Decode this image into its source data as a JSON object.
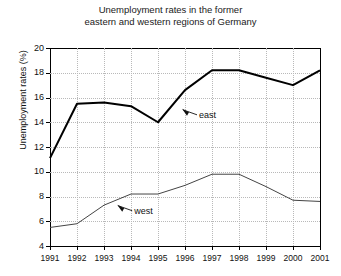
{
  "chart_data": {
    "type": "line",
    "title": "Unemployment rates in the former eastern and western regions of Germany",
    "title_line1": "Unemployment rates in the former",
    "title_line2": "eastern and western regions of Germany",
    "xlabel": "",
    "ylabel": "Unemployment rates (%)",
    "xlim": [
      1991,
      2001
    ],
    "ylim": [
      4,
      20
    ],
    "ytick_step": 2,
    "grid": true,
    "legend_position": "inline-annotations",
    "categories": [
      1991,
      1992,
      1993,
      1994,
      1995,
      1996,
      1997,
      1998,
      1999,
      2000,
      2001
    ],
    "tick_labels_x": [
      "1991",
      "1992",
      "1993",
      "1994",
      "1995",
      "1996",
      "1997",
      "1998",
      "1999",
      "2000",
      "2001"
    ],
    "tick_labels_y": [
      "4",
      "6",
      "8",
      "10",
      "12",
      "14",
      "16",
      "18",
      "20"
    ],
    "series": [
      {
        "name": "east",
        "color": "#000000",
        "line_width": 2,
        "values": [
          11.1,
          15.5,
          15.6,
          15.3,
          14.0,
          16.6,
          18.2,
          18.2,
          17.6,
          17.0,
          18.2
        ]
      },
      {
        "name": "west",
        "color": "#444444",
        "line_width": 1,
        "values": [
          5.5,
          5.8,
          7.3,
          8.2,
          8.2,
          8.9,
          9.8,
          9.8,
          8.8,
          7.7,
          7.6
        ]
      }
    ],
    "annotations": [
      {
        "label": "east",
        "x": 1996.0,
        "y": 14.6
      },
      {
        "label": "west",
        "x": 1993.6,
        "y": 6.85
      }
    ]
  }
}
